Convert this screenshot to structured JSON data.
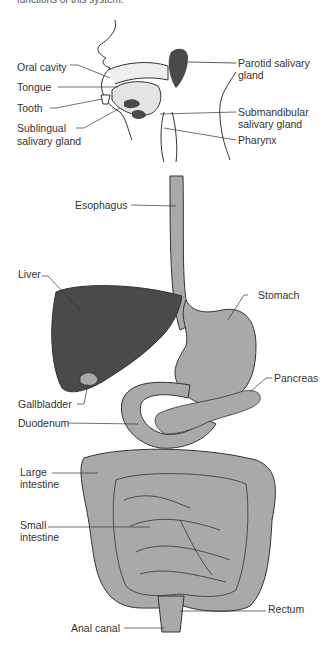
{
  "caption": "functions of this system.",
  "colors": {
    "organ": "#a9a9a9",
    "dark_organ": "#4a4a4a",
    "outline": "#333333",
    "background": "#ffffff"
  },
  "labels": {
    "oral_cavity": "Oral cavity",
    "tongue": "Tongue",
    "tooth": "Tooth",
    "sublingual_1": "Sublingual",
    "sublingual_2": "salivary gland",
    "parotid_1": "Parotid salivary",
    "parotid_2": "gland",
    "submandibular_1": "Submandibular",
    "submandibular_2": "salivary gland",
    "pharynx": "Pharynx",
    "esophagus": "Esophagus",
    "liver": "Liver",
    "stomach": "Stomach",
    "pancreas": "Pancreas",
    "gallbladder": "Gallbladder",
    "duodenum": "Duodenum",
    "large_intestine_1": "Large",
    "large_intestine_2": "intestine",
    "small_intestine_1": "Small",
    "small_intestine_2": "intestine",
    "rectum": "Rectum",
    "anal_canal": "Anal canal"
  }
}
